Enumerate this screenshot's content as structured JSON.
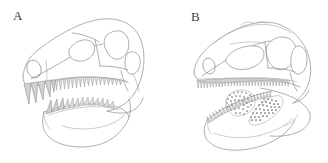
{
  "figure": {
    "background_color": "#ffffff",
    "line_color": "#8d8d8d",
    "tooth_fill_color": "#d2d2d2",
    "stipple_color": "#6f6f6f",
    "width": 328,
    "height": 163
  },
  "panels": [
    {
      "id": "panel-a",
      "label": "A",
      "subject": "theropod-skull-lateral-view",
      "features": [
        "premaxillary-teeth",
        "maxillary-tooth-row",
        "dentary-tooth-row",
        "antorbital-fenestra",
        "orbit",
        "external-naris",
        "infratemporal-fenestra",
        "lower-jaw"
      ]
    },
    {
      "id": "panel-b",
      "label": "B",
      "subject": "theropod-skull-lateral-view",
      "features": [
        "maxillary-tooth-row",
        "dentary-tooth-row",
        "antorbital-fenestra",
        "orbit",
        "external-naris",
        "infratemporal-fenestra",
        "stippled-shaded-region",
        "lower-jaw"
      ]
    }
  ]
}
